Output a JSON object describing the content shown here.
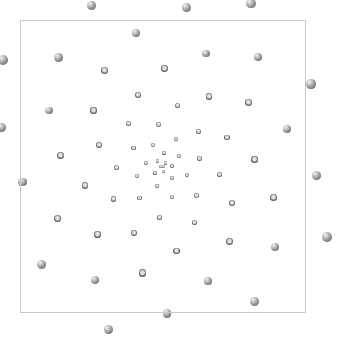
{
  "figure": {
    "kind": "generative-pattern",
    "width": 340,
    "height": 337,
    "background_color": "#ffffff"
  },
  "frame": {
    "label": "plot frame",
    "x": 20,
    "y": 20,
    "width": 286,
    "height": 293,
    "border_color": "#c9c9c9",
    "border_width": 1
  },
  "background_gradient": {
    "label": "center glow",
    "type": "radial",
    "center_x": 163,
    "center_y": 166,
    "inner_color": "#b4b4b4",
    "outer_color": "#ffffff",
    "inner_stop_pct": 0,
    "outer_stop_pct": 62
  },
  "sphere_style": {
    "label": "shaded gray sphere",
    "highlight_color": "#f2f2f2",
    "mid_color": "#9b9b9b",
    "edge_color": "#5e5e5e",
    "rim_color": "#4a4a4a",
    "highlight_offset_x_pct": 33,
    "highlight_offset_y_pct": 29
  },
  "spiral": {
    "label": "phyllotaxis logarithmic spiral",
    "center_x": 163,
    "center_y": 166,
    "point_count": 200,
    "divergence_angle_deg": 137.5,
    "radius_coefficient": 1.02,
    "radius_exponent": 1.22,
    "size_coefficient": 0.055,
    "size_exponent": 1.12,
    "min_diameter": 3.2,
    "max_diameter": 21,
    "rotation_offset_deg": -104,
    "max_radius": 196
  },
  "legend": {
    "visible": false,
    "entries": []
  },
  "axes": {
    "visible": false,
    "x_label": "",
    "y_label": "",
    "tick_labels": []
  },
  "annotations": []
}
